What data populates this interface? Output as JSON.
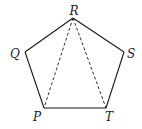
{
  "diagram": {
    "type": "pentagon",
    "vertices": [
      {
        "name": "R",
        "x": 73,
        "y": 18,
        "label_x": 74,
        "label_y": 15
      },
      {
        "name": "S",
        "x": 124,
        "y": 52,
        "label_x": 131,
        "label_y": 58
      },
      {
        "name": "T",
        "x": 106,
        "y": 108,
        "label_x": 109,
        "label_y": 121
      },
      {
        "name": "P",
        "x": 44,
        "y": 108,
        "label_x": 37,
        "label_y": 121
      },
      {
        "name": "Q",
        "x": 25,
        "y": 52,
        "label_x": 15,
        "label_y": 58
      }
    ],
    "edges": [
      [
        "R",
        "S"
      ],
      [
        "S",
        "T"
      ],
      [
        "T",
        "P"
      ],
      [
        "P",
        "Q"
      ],
      [
        "Q",
        "R"
      ]
    ],
    "dashed_segments": [
      [
        "R",
        "P"
      ],
      [
        "R",
        "T"
      ]
    ],
    "labels": {
      "R": "R",
      "S": "S",
      "T": "T",
      "P": "P",
      "Q": "Q"
    }
  }
}
